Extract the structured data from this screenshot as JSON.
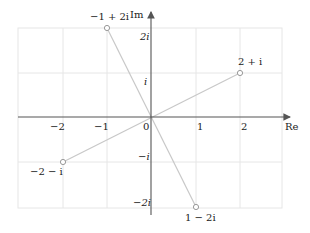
{
  "figure": {
    "type": "complex-plane",
    "axes": {
      "x_label": "Re",
      "y_label": "Im",
      "x_ticks": [
        {
          "value": -2,
          "label": "−2"
        },
        {
          "value": -1,
          "label": "−1"
        },
        {
          "value": 0,
          "label": "0"
        },
        {
          "value": 1,
          "label": "1"
        },
        {
          "value": 2,
          "label": "2"
        }
      ],
      "y_ticks": [
        {
          "value": 2,
          "label": "2i"
        },
        {
          "value": 1,
          "label": "i"
        },
        {
          "value": -1,
          "label": "−i"
        },
        {
          "value": -2,
          "label": "−2i"
        }
      ],
      "grid": true,
      "xlim": [
        -3,
        3
      ],
      "ylim": [
        -2,
        2
      ]
    },
    "points": [
      {
        "re": -1,
        "im": 2,
        "label": "−1 + 2i"
      },
      {
        "re": 2,
        "im": 1,
        "label": "2 + i"
      },
      {
        "re": -2,
        "im": -1,
        "label": "−2 − i"
      },
      {
        "re": 1,
        "im": -2,
        "label": "1 − 2i"
      }
    ],
    "segments": [
      {
        "from": [
          -1,
          2
        ],
        "to": [
          1,
          -2
        ]
      },
      {
        "from": [
          -2,
          -1
        ],
        "to": [
          2,
          1
        ]
      }
    ],
    "colors": {
      "grid": "#e6e6e6",
      "axis": "#555555",
      "segment": "#c8c8c8",
      "point_stroke": "#999999"
    }
  }
}
